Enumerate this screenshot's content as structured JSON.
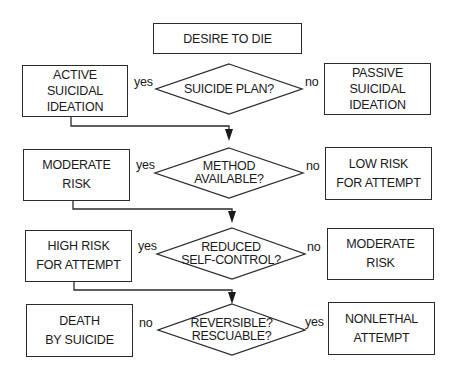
{
  "start": {
    "label": "DESIRE TO DIE"
  },
  "rows": [
    {
      "question": [
        "SUICIDE PLAN?"
      ],
      "left": {
        "edge": "yes",
        "outcome": [
          "ACTIVE",
          "SUICIDAL",
          "IDEATION"
        ]
      },
      "right": {
        "edge": "no",
        "outcome": [
          "PASSIVE",
          "SUICIDAL",
          "IDEATION"
        ]
      }
    },
    {
      "question": [
        "METHOD",
        "AVAILABLE?"
      ],
      "left": {
        "edge": "yes",
        "outcome": [
          "MODERATE",
          "RISK"
        ]
      },
      "right": {
        "edge": "no",
        "outcome": [
          "LOW RISK",
          "FOR ATTEMPT"
        ]
      }
    },
    {
      "question": [
        "REDUCED",
        "SELF-CONTROL?"
      ],
      "left": {
        "edge": "yes",
        "outcome": [
          "HIGH RISK",
          "FOR ATTEMPT"
        ]
      },
      "right": {
        "edge": "no",
        "outcome": [
          "MODERATE",
          "RISK"
        ]
      }
    },
    {
      "question": [
        "REVERSIBLE?",
        "RESCUABLE?"
      ],
      "left": {
        "edge": "no",
        "outcome": [
          "DEATH",
          "BY SUICIDE"
        ]
      },
      "right": {
        "edge": "yes",
        "outcome": [
          "NONLETHAL",
          "ATTEMPT"
        ]
      }
    }
  ],
  "colors": {
    "stroke": "#2a2a2a",
    "background": "#ffffff",
    "text": "#1a1a1a"
  }
}
